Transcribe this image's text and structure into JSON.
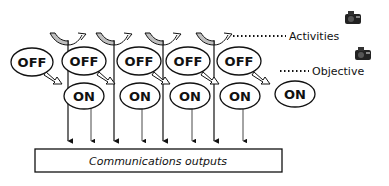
{
  "diagram": {
    "off_states": [
      {
        "label": "OFF"
      },
      {
        "label": "OFF"
      },
      {
        "label": "OFF"
      },
      {
        "label": "OFF"
      },
      {
        "label": "OFF"
      }
    ],
    "on_states": [
      {
        "label": "ON"
      },
      {
        "label": "ON"
      },
      {
        "label": "ON"
      },
      {
        "label": "ON"
      },
      {
        "label": "ON"
      }
    ],
    "annotations": {
      "activities": "Activities",
      "objective": "Objective"
    },
    "output_box": {
      "label": "Communications outputs"
    },
    "icons": [
      "camera-icon",
      "camera-icon"
    ],
    "colors": {
      "stroke": "#111111",
      "curl_fill": "#bfbfbf",
      "camera": "#222222"
    }
  }
}
